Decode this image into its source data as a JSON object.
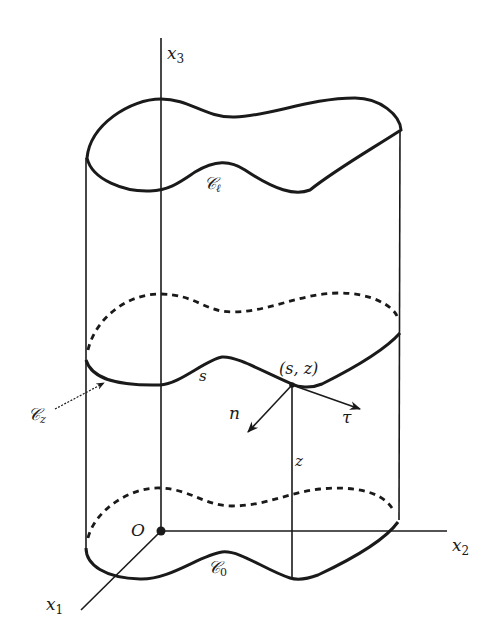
{
  "diagram": {
    "type": "cylinder-cross-section",
    "stroke_color": "#1a1a1a",
    "axes": {
      "x1": {
        "label": "x",
        "subscript": "1"
      },
      "x2": {
        "label": "x",
        "subscript": "2"
      },
      "x3": {
        "label": "x",
        "subscript": "3"
      },
      "origin": {
        "label": "O"
      }
    },
    "curves": {
      "top": {
        "label": "𝒞",
        "subscript": "ℓ"
      },
      "middle": {
        "label": "𝒞",
        "subscript": "z"
      },
      "bottom": {
        "label": "𝒞",
        "subscript": "0"
      }
    },
    "point": {
      "label": "(s, z)"
    },
    "arc_label": "s",
    "height_label": "z",
    "vectors": {
      "normal": {
        "label": "n"
      },
      "tangent": {
        "label": "τ"
      }
    }
  }
}
